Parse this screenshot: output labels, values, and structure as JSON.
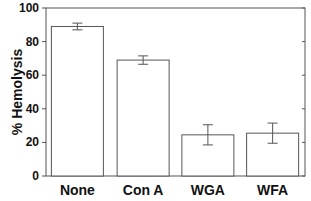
{
  "chart_data": {
    "type": "bar",
    "title": "",
    "xlabel": "",
    "ylabel": "% Hemolysis",
    "ylim": [
      0,
      100
    ],
    "yticks": [
      0,
      20,
      40,
      60,
      80,
      100
    ],
    "categories": [
      "None",
      "Con A",
      "WGA",
      "WFA"
    ],
    "values": [
      89,
      69,
      24.5,
      25.5
    ],
    "errors": [
      2,
      2.5,
      6,
      6
    ],
    "grid": false,
    "legend": null,
    "colors": {
      "bar_fill": "#ffffff",
      "stroke": "#555555"
    }
  }
}
